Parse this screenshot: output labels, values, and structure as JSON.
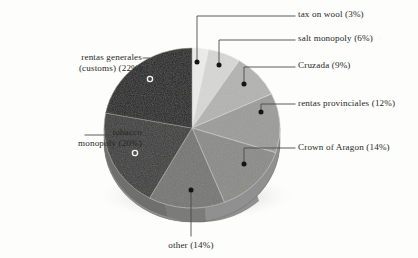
{
  "figure": {
    "type": "pie-3d",
    "background_color": "#fdfdfb",
    "text_color": "#282828"
  },
  "chart_data": {
    "type": "pie",
    "title": "",
    "xlabel": "",
    "ylabel": "",
    "legend_position": "callout-labels",
    "grid": false,
    "total_percent": 100,
    "start_angle_deg": 0,
    "direction": "clockwise",
    "categories": [
      "tax on wool",
      "salt monopoly",
      "Cruzada",
      "rentas provinciales",
      "Crown of Aragon",
      "other",
      "tobacco monopoly",
      "rentas generales (customs)"
    ],
    "values": [
      3,
      6,
      9,
      12,
      14,
      14,
      20,
      22
    ],
    "slices": [
      {
        "name": "tax on wool",
        "label": "tax on wool (3%)",
        "value": 3,
        "color": "#ededeb",
        "marker": "filled-dot",
        "marker_color": "#141414",
        "label_side": "right"
      },
      {
        "name": "salt monopoly",
        "label": "salt monopoly (6%)",
        "value": 6,
        "color": "#d7d7d4",
        "marker": "filled-dot",
        "marker_color": "#141414",
        "label_side": "right"
      },
      {
        "name": "Cruzada",
        "label": "Cruzada (9%)",
        "value": 9,
        "color": "#b3b3b0",
        "marker": "filled-dot",
        "marker_color": "#141414",
        "label_side": "right"
      },
      {
        "name": "rentas provinciales",
        "label": "rentas provinciales (12%)",
        "value": 12,
        "color": "#9b9b98",
        "marker": "filled-dot",
        "marker_color": "#141414",
        "label_side": "right"
      },
      {
        "name": "Crown of Aragon",
        "label": "Crown of Aragon (14%)",
        "value": 14,
        "color": "#8a8a87",
        "marker": "filled-dot",
        "marker_color": "#141414",
        "label_side": "right"
      },
      {
        "name": "other",
        "label": "other (14%)",
        "value": 14,
        "color": "#757573",
        "marker": "filled-dot",
        "marker_color": "#141414",
        "label_side": "bottom"
      },
      {
        "name": "tobacco monopoly",
        "label_line1": "tobacco",
        "label_line2": "monopoly (20%)",
        "value": 20,
        "color": "#3a3a39",
        "marker": "hollow-circle",
        "marker_color": "#f2f2f0",
        "label_side": "left"
      },
      {
        "name": "rentas generales",
        "label_line1": "rentas generales",
        "label_line2": "(customs) (22%)",
        "value": 22,
        "color": "#1f1f1e",
        "marker": "hollow-circle",
        "marker_color": "#f2f2f0",
        "label_side": "left"
      }
    ]
  },
  "geometry": {
    "center_x": 192,
    "center_y": 128,
    "radius_x": 88,
    "radius_y": 80,
    "depth": 14
  },
  "leaders": {
    "color": "#4a4a4a"
  }
}
